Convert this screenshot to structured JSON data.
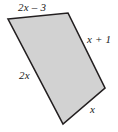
{
  "figure": {
    "kind": "quadrilateral-with-side-labels",
    "background_color": "#ffffff",
    "fill_color": "#d2d2d2",
    "stroke_color": "#231f20",
    "stroke_width": 1.6,
    "vertices": [
      {
        "name": "top-left",
        "x": 8,
        "y": 19
      },
      {
        "name": "top-right",
        "x": 68,
        "y": 13
      },
      {
        "name": "right",
        "x": 105,
        "y": 88
      },
      {
        "name": "bottom",
        "x": 63,
        "y": 124
      }
    ],
    "sides": [
      {
        "name": "top-side",
        "from": "top-left",
        "to": "top-right",
        "label": "2x – 3"
      },
      {
        "name": "upper-right-side",
        "from": "top-right",
        "to": "right",
        "label": "x + 1"
      },
      {
        "name": "lower-right-side",
        "from": "right",
        "to": "bottom",
        "label": "x"
      },
      {
        "name": "left-side",
        "from": "bottom",
        "to": "top-left",
        "label": "2x"
      }
    ],
    "labels": {
      "top": "2x – 3",
      "upper_right": "x + 1",
      "lower_right": "x",
      "left": "2x"
    }
  }
}
